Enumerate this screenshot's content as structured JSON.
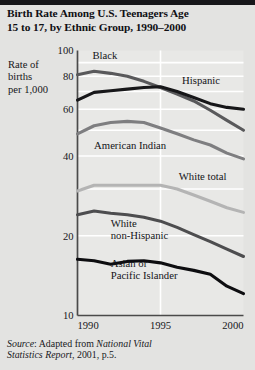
{
  "figure": {
    "title_line1": "Birth Rate Among U.S. Teenagers Age",
    "title_line2": "15 to 17, by Ethnic Group, 1990–2000",
    "axis_caption_line1": "Rate of",
    "axis_caption_line2": "births",
    "axis_caption_line3": "per 1,000",
    "source_prefix": "Source",
    "source_line1_a": ": Adapted from ",
    "source_line1_b": "National Vital",
    "source_line2_a": "Statistics Report",
    "source_line2_b": ", 2001, p.5.",
    "background_color": "#e3e3e1",
    "plot_background_color": "#e8e8e6",
    "gridline_color": "#ffffff",
    "axis_color": "#4a4a4a"
  },
  "chart_data": {
    "type": "line",
    "title": "Birth Rate Among U.S. Teenagers Age 15 to 17, by Ethnic Group, 1990–2000",
    "xlabel": "",
    "ylabel": "Rate of births per 1,000",
    "yscale": "log",
    "ylim": [
      10,
      100
    ],
    "xlim": [
      1990,
      2000
    ],
    "grid": true,
    "legend_position": "inline-labels",
    "y_tick_labels": [
      "100",
      "80",
      "60",
      "40",
      "20",
      "10"
    ],
    "y_tick_values": [
      100,
      80,
      60,
      40,
      20,
      10
    ],
    "x_tick_labels": [
      "1990",
      "1995",
      "2000"
    ],
    "x_tick_values": [
      1990,
      1995,
      2000
    ],
    "x": [
      1990,
      1991,
      1992,
      1993,
      1994,
      1995,
      1996,
      1997,
      1998,
      1999,
      2000
    ],
    "series": [
      {
        "name": "Black",
        "color": "#59595b",
        "width": 3.1,
        "label_x": 1990.9,
        "label_y": 93,
        "label_anchor": "start",
        "values": [
          81.0,
          83.5,
          82.0,
          80.0,
          76.5,
          72.5,
          68.5,
          64.5,
          59.5,
          54.5,
          50.0
        ]
      },
      {
        "name": "Hispanic",
        "color": "#171719",
        "width": 3.1,
        "label_x": 1996.3,
        "label_y": 74.5,
        "label_anchor": "start",
        "values": [
          65.0,
          69.5,
          70.5,
          71.5,
          72.5,
          73.0,
          70.0,
          66.5,
          63.0,
          61.0,
          60.0
        ]
      },
      {
        "name": "American Indian",
        "color": "#7e7e80",
        "width": 3.1,
        "label_x": 1991.0,
        "label_y": 42.5,
        "label_anchor": "start",
        "values": [
          48.5,
          52.0,
          53.5,
          54.0,
          53.5,
          51.0,
          48.5,
          46.0,
          44.0,
          41.0,
          39.0
        ]
      },
      {
        "name": "White total",
        "color": "#b4b4b4",
        "width": 3.1,
        "label_x": 1996.1,
        "label_y": 32.5,
        "label_anchor": "start",
        "values": [
          29.5,
          31.0,
          31.0,
          31.0,
          31.0,
          31.0,
          30.0,
          28.5,
          27.0,
          25.5,
          24.5
        ]
      },
      {
        "name": "White non-Hispanic",
        "color": "#4d4d4f",
        "width": 3.1,
        "label_x": 1992.0,
        "label_y": 21.5,
        "label_anchor": "start",
        "values": [
          24.0,
          24.8,
          24.3,
          24.0,
          23.5,
          22.7,
          21.5,
          20.2,
          19.0,
          17.8,
          16.7
        ]
      },
      {
        "name": "Asian or Pacific Islander",
        "color": "#0d0d10",
        "width": 3.1,
        "label_x": 1992.0,
        "label_y": 15.2,
        "label_anchor": "start",
        "values": [
          16.3,
          16.1,
          15.6,
          16.0,
          16.1,
          15.8,
          15.2,
          14.8,
          14.3,
          12.9,
          12.1
        ]
      }
    ],
    "series_label_lines": {
      "Black": [
        "Black"
      ],
      "Hispanic": [
        "Hispanic"
      ],
      "American Indian": [
        "American Indian"
      ],
      "White total": [
        "White total"
      ],
      "White non-Hispanic": [
        "White",
        "non-Hispanic"
      ],
      "Asian or Pacific Islander": [
        "Asian or",
        "Pacific Islander"
      ]
    }
  }
}
